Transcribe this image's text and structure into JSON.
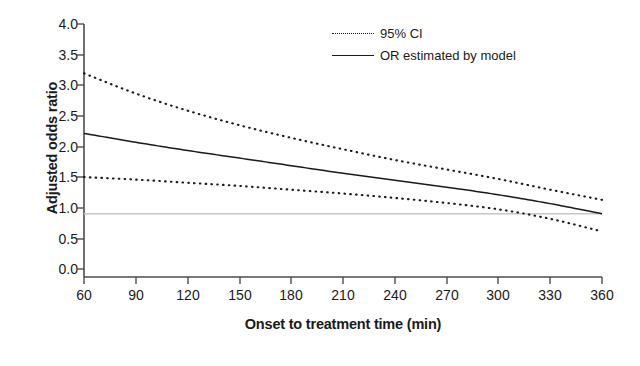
{
  "chart_data": {
    "type": "line",
    "title": "",
    "xlabel": "Onset to treatment time (min)",
    "ylabel": "Adjusted odds ratio",
    "xlim": [
      60,
      360
    ],
    "ylim": [
      0.0,
      4.0
    ],
    "xticks": [
      60,
      90,
      120,
      150,
      180,
      210,
      240,
      270,
      300,
      330,
      360
    ],
    "yticks": [
      "0.0",
      "0.5",
      "1.0",
      "1.5",
      "2.0",
      "2.5",
      "3.0",
      "3.5",
      "4.0"
    ],
    "grid": "horizontal reference line at y = 1.0",
    "legend_position": "top-right inside plot",
    "reference_line": {
      "y": 1.0,
      "color": "#c8c8c8"
    },
    "x": [
      60,
      90,
      120,
      150,
      180,
      210,
      240,
      270,
      300,
      330,
      360
    ],
    "series": [
      {
        "name": "95% CI upper",
        "style": "dotted",
        "color": "#1a1a1a",
        "values": [
          3.22,
          2.9,
          2.63,
          2.4,
          2.2,
          2.02,
          1.85,
          1.7,
          1.55,
          1.38,
          1.22
        ]
      },
      {
        "name": "OR estimated by model",
        "style": "solid",
        "color": "#1a1a1a",
        "values": [
          2.27,
          2.13,
          2.0,
          1.88,
          1.76,
          1.64,
          1.53,
          1.42,
          1.3,
          1.16,
          1.0
        ]
      },
      {
        "name": "95% CI lower",
        "style": "dotted",
        "color": "#1a1a1a",
        "values": [
          1.58,
          1.54,
          1.49,
          1.44,
          1.38,
          1.32,
          1.25,
          1.17,
          1.07,
          0.92,
          0.72
        ]
      }
    ]
  },
  "legend": {
    "items": [
      {
        "label": "95% CI",
        "style": "dotted"
      },
      {
        "label": "OR estimated by model",
        "style": "solid"
      }
    ]
  },
  "axes": {
    "y_title": "Adjusted odds ratio",
    "x_title": "Onset to treatment time (min)",
    "y_tick_labels": [
      "4.0",
      "3.5",
      "3.0",
      "2.5",
      "2.0",
      "1.5",
      "1.0",
      "0.5",
      "0.0"
    ],
    "x_tick_labels": [
      "60",
      "90",
      "120",
      "150",
      "180",
      "210",
      "240",
      "270",
      "300",
      "330",
      "360"
    ]
  },
  "colors": {
    "axis": "#4d4d4d",
    "line": "#1a1a1a",
    "reference": "#c8c8c8",
    "background": "#ffffff"
  }
}
